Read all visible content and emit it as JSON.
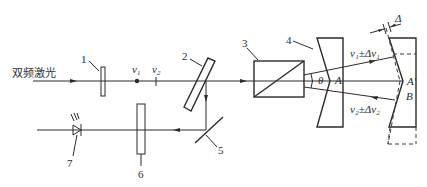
{
  "diagram": {
    "input_label": "双频激光",
    "component_numbers": [
      "1",
      "2",
      "3",
      "4",
      "5",
      "6",
      "7"
    ],
    "freq_labels": {
      "v1": "ν",
      "v1_sub": "1",
      "v2": "ν",
      "v2_sub": "2"
    },
    "beam_labels": {
      "upper": "ν₁±Δν₁",
      "lower": "ν₂±Δν₂"
    },
    "angle_label": "θ",
    "point_labels": {
      "A": "A",
      "A_prime": "A′",
      "B": "B"
    },
    "displacement_label": "Δ",
    "colors": {
      "line": "#2b2b2b",
      "background": "#ffffff"
    }
  }
}
